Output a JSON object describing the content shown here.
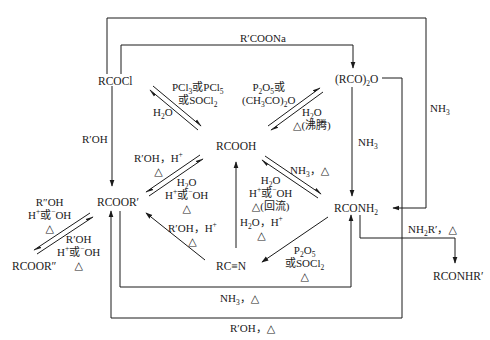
{
  "diagram": {
    "type": "reaction-scheme",
    "nodes": {
      "acyl_chloride": "RCOCl",
      "anhydride_pre": "(RCO)",
      "anhydride_sub": "2",
      "anhydride_post": "O",
      "acid": "RCOOH",
      "ester": "RCOOR′",
      "ester2": "RCOOR″",
      "amide_pre": "RCONH",
      "amide_sub": "2",
      "nitrile": "RC≡N",
      "sec_amide": "RCONHR′"
    },
    "conditions": {
      "rcoona": "R′COONa",
      "nh3_outer": "NH",
      "nh3_outer_sub": "3",
      "nh3_anh": "NH",
      "nh3_anh_sub": "3",
      "acid_to_chloride_l1a": "PCl",
      "acid_to_chloride_l1a_sub": "3",
      "acid_to_chloride_l1b": "或PCl",
      "acid_to_chloride_l1b_sub": "5",
      "acid_to_chloride_l2a": "或SOCl",
      "acid_to_chloride_l2a_sub": "2",
      "chloride_hydrolysis_a": "H",
      "chloride_hydrolysis_sub": "2",
      "chloride_hydrolysis_b": "O",
      "acid_to_anh_l1a": "P",
      "acid_to_anh_l1a_sub": "2",
      "acid_to_anh_l1b": "O",
      "acid_to_anh_l1b_sub": "5",
      "acid_to_anh_l1c": "或",
      "acid_to_anh_l2a": "(CH",
      "acid_to_anh_l2a_sub": "3",
      "acid_to_anh_l2b": "CO)",
      "acid_to_anh_l2b_sub": "2",
      "acid_to_anh_l2c": "O",
      "anh_hydrolysis_a": "H",
      "anh_hydrolysis_sub": "2",
      "anh_hydrolysis_b": "O",
      "anh_hydrolysis_l2": "△(沸腾)",
      "r_oh": "R′OH",
      "esterify_l1": "R′OH，H",
      "esterify_l1_sup": "+",
      "esterify_l2": "△",
      "ester_hydro_l1a": "H",
      "ester_hydro_l1_sub": "2",
      "ester_hydro_l1b": "O",
      "ester_hydro_l2a": "H",
      "ester_hydro_l2_sup1": "+",
      "ester_hydro_l2b": "或",
      "ester_hydro_l2_sup2": "−",
      "ester_hydro_l2c": "OH",
      "ester_hydro_l3": "△",
      "amidation_l1a": "NH",
      "amidation_l1_sub": "3",
      "amidation_l1b": "，△",
      "amide_hydro_l1a": "H",
      "amide_hydro_l1_sub": "2",
      "amide_hydro_l1b": "O",
      "amide_hydro_l2a": "H",
      "amide_hydro_l2_sup1": "+",
      "amide_hydro_l2b": "或",
      "amide_hydro_l2_sup2": "−",
      "amide_hydro_l2c": "OH",
      "amide_hydro_l3": "△(回流)",
      "nitrile_hydro_l1a": "H",
      "nitrile_hydro_l1_sub": "2",
      "nitrile_hydro_l1b": "O，H",
      "nitrile_hydro_l1_sup": "+",
      "nitrile_hydro_l2": "△",
      "nitrile_alc_l1a": "R′OH，H",
      "nitrile_alc_l1_sup": "+",
      "nitrile_alc_l2": "△",
      "dehydrate_l1a": "P",
      "dehydrate_l1_sub1": "2",
      "dehydrate_l1b": "O",
      "dehydrate_l1_sub2": "5",
      "dehydrate_l2a": "或SOCl",
      "dehydrate_l2_sub": "2",
      "dehydrate_l3": "△",
      "transest_fwd_l1": "R″OH",
      "transest_fwd_l2a": "H",
      "transest_fwd_l2_sup1": "+",
      "transest_fwd_l2b": "或",
      "transest_fwd_l2_sup2": "−",
      "transest_fwd_l2c": "OH",
      "transest_fwd_l3": "△",
      "transest_rev_l1": "R′OH",
      "transest_rev_l2a": "H",
      "transest_rev_l2_sup1": "+",
      "transest_rev_l2b": "或",
      "transest_rev_l2_sup2": "−",
      "transest_rev_l2c": "OH",
      "transest_rev_l3": "△",
      "aminolysis_a": "NH",
      "aminolysis_sub": "3",
      "aminolysis_b": "，△",
      "alcoholysis": "R′OH，△",
      "amine_a": "NH",
      "amine_sub": "2",
      "amine_b": "R′，△"
    }
  }
}
